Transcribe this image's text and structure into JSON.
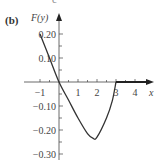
{
  "panel": {
    "label": "(b)",
    "clipped_char": "c"
  },
  "chart_data": {
    "type": "line",
    "title": "",
    "xlabel": "x",
    "ylabel": "F(y)",
    "xlim": [
      -1.2,
      4.6
    ],
    "ylim": [
      -0.32,
      0.24
    ],
    "grid": false,
    "legend": null,
    "x_ticks": [
      -1,
      1,
      2,
      3,
      4
    ],
    "x_tick_labels": [
      "−1",
      "1",
      "2",
      "3",
      "4"
    ],
    "y_ticks": [
      0.2,
      0.1,
      -0.1,
      -0.2,
      -0.3
    ],
    "y_tick_labels": [
      "0.20",
      "0.10",
      "−0.10",
      "−0.20",
      "−0.30"
    ],
    "series": [
      {
        "name": "F(y)",
        "x": [
          -1,
          -0.5,
          0,
          0.5,
          1,
          1.5,
          1.8,
          2,
          2.5,
          2.8,
          3
        ],
        "values": [
          0.2,
          0.1,
          0.0,
          -0.075,
          -0.15,
          -0.215,
          -0.235,
          -0.23,
          -0.15,
          -0.08,
          0.0
        ]
      },
      {
        "name": "F(y)=0 for y>3",
        "x": [
          3,
          4.5
        ],
        "values": [
          0,
          0
        ]
      }
    ]
  }
}
